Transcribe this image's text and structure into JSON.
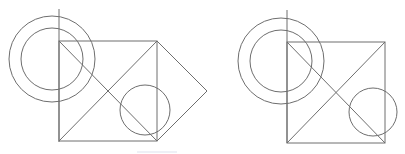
{
  "diagram": {
    "stroke_color": "#6e6e6e",
    "background": "#ffffff",
    "figures": [
      {
        "name": "left-figure",
        "vertical_line": {
          "x": 59,
          "y1": 9,
          "y2": 142
        },
        "square": {
          "x": 59,
          "y": 41,
          "w": 98,
          "h": 100
        },
        "diagonals": [
          [
            59,
            41,
            157,
            141
          ],
          [
            59,
            141,
            157,
            41
          ]
        ],
        "outer_circle": {
          "cx": 52,
          "cy": 59,
          "r": 43
        },
        "inner_circle": {
          "cx": 52,
          "cy": 59,
          "r": 31
        },
        "small_circle": {
          "cx": 145,
          "cy": 110,
          "r": 25
        },
        "diamond": "157,41 207,91 157,141"
      },
      {
        "name": "right-figure",
        "vertical_line": {
          "x": 287,
          "y1": 10,
          "y2": 143
        },
        "square": {
          "x": 287,
          "y": 42,
          "w": 98,
          "h": 101
        },
        "diagonals": [
          [
            287,
            42,
            385,
            143
          ],
          [
            287,
            143,
            385,
            42
          ]
        ],
        "outer_circle": {
          "cx": 281,
          "cy": 61,
          "r": 43
        },
        "inner_circle": {
          "cx": 281,
          "cy": 61,
          "r": 31
        },
        "small_circle": {
          "cx": 373,
          "cy": 112,
          "r": 24
        }
      }
    ],
    "bottom_bar": {
      "x": 137,
      "y": 151,
      "w": 40
    }
  }
}
